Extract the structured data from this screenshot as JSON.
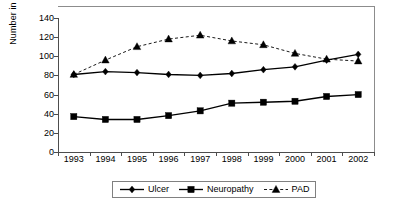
{
  "chart_data": {
    "type": "line",
    "title": "",
    "xlabel": "",
    "ylabel": "Number in thousands",
    "categories": [
      "1993",
      "1994",
      "1995",
      "1996",
      "1997",
      "1998",
      "1999",
      "2000",
      "2001",
      "2002"
    ],
    "ylim": [
      0,
      140
    ],
    "yticks": [
      "0",
      "20",
      "40",
      "60",
      "80",
      "100",
      "120",
      "140"
    ],
    "ytick_values": [
      0,
      20,
      40,
      60,
      80,
      100,
      120,
      140
    ],
    "grid": false,
    "legend_position": "bottom",
    "series": [
      {
        "name": "Ulcer",
        "marker": "diamond",
        "line_style": "solid",
        "color": "#000000",
        "values": [
          81,
          84,
          83,
          81,
          80,
          82,
          86,
          89,
          96,
          102
        ]
      },
      {
        "name": "Neuropathy",
        "marker": "square",
        "line_style": "solid",
        "color": "#000000",
        "values": [
          37,
          34,
          34,
          38,
          43,
          51,
          52,
          53,
          58,
          60
        ]
      },
      {
        "name": "PAD",
        "marker": "triangle",
        "line_style": "dashed",
        "color": "#000000",
        "values": [
          81,
          96,
          110,
          118,
          122,
          116,
          112,
          103,
          97,
          95
        ]
      }
    ]
  },
  "legend": {
    "entries": [
      {
        "label": "Ulcer"
      },
      {
        "label": "Neuropathy"
      },
      {
        "label": "PAD"
      }
    ]
  }
}
